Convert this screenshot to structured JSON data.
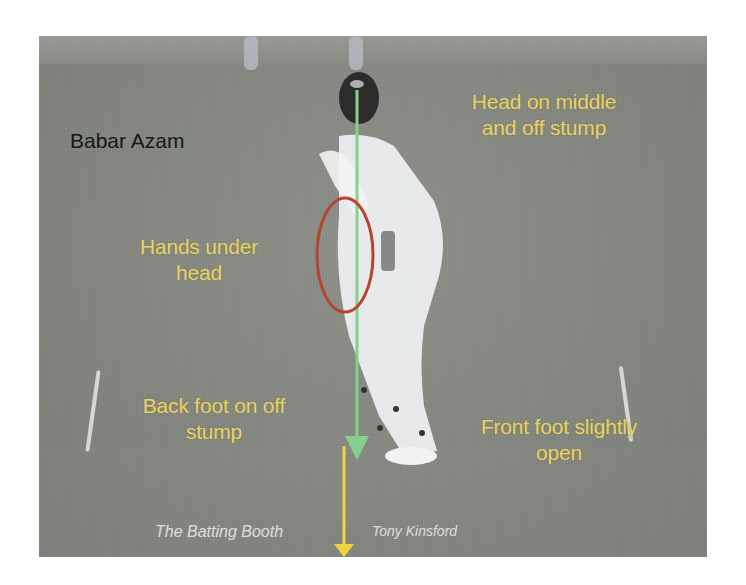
{
  "figure": {
    "subject_name": "Babar Azam",
    "annotations": {
      "head": "Head on middle and off stump",
      "head_line1": "Head on middle",
      "head_line2": "and off stump",
      "hands_line1": "Hands under",
      "hands_line2": "head",
      "back_foot_line1": "Back foot on off",
      "back_foot_line2": "stump",
      "front_foot_line1": "Front foot slightly",
      "front_foot_line2": "open"
    },
    "credits": {
      "left": "The Batting Booth",
      "right": "Tony Kinsford"
    },
    "colors": {
      "annotation_text": "#e8d36a",
      "name_text": "#161616",
      "green_arrow": "#86d08e",
      "yellow_arrow": "#f2d23c",
      "red_circle": "#b8432e",
      "ground": "#858881"
    }
  }
}
